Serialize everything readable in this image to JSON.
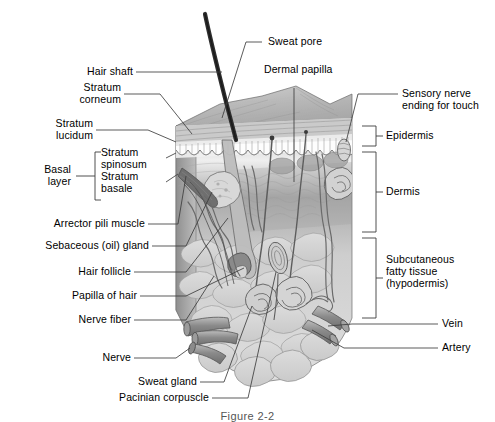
{
  "figure": {
    "caption": "Figure 2-2",
    "colors": {
      "ink": "#1a1a1a",
      "leader": "#3d3d3d",
      "hair": "#2f2f2f",
      "epidermis_top": "#b9b9b9",
      "epidermis_face": "#9a9a9a",
      "dermis": "#c9c9c9",
      "hypodermis": "#dcdcdc",
      "vessel": "#8d8d8d",
      "outline": "#5a5a5a"
    }
  },
  "labels_left": [
    {
      "id": "hair-shaft",
      "text": "Hair shaft"
    },
    {
      "id": "stratum-corneum",
      "text": "Stratum\ncorneum"
    },
    {
      "id": "stratum-lucidum",
      "text": "Stratum\nlucidum"
    },
    {
      "id": "basal-layer",
      "text": "Basal\nlayer"
    },
    {
      "id": "stratum-spinosum",
      "text": "Stratum\nspinosum"
    },
    {
      "id": "stratum-basale",
      "text": "Stratum\nbasale"
    },
    {
      "id": "arrector-pili-muscle",
      "text": "Arrector pili muscle"
    },
    {
      "id": "sebaceous-gland",
      "text": "Sebaceous (oil) gland"
    },
    {
      "id": "hair-follicle",
      "text": "Hair follicle"
    },
    {
      "id": "papilla-of-hair",
      "text": "Papilla of hair"
    },
    {
      "id": "nerve-fiber",
      "text": "Nerve fiber"
    },
    {
      "id": "nerve",
      "text": "Nerve"
    },
    {
      "id": "sweat-gland",
      "text": "Sweat gland"
    },
    {
      "id": "pacinian-corpuscle",
      "text": "Pacinian corpuscle"
    }
  ],
  "labels_top": [
    {
      "id": "sweat-pore",
      "text": "Sweat pore"
    },
    {
      "id": "dermal-papilla",
      "text": "Dermal papilla"
    }
  ],
  "labels_right": [
    {
      "id": "sensory-nerve-ending",
      "text": "Sensory nerve\nending for touch"
    },
    {
      "id": "epidermis",
      "text": "Epidermis"
    },
    {
      "id": "dermis",
      "text": "Dermis"
    },
    {
      "id": "subcutaneous-fatty-tissue",
      "text": "Subcutaneous\nfatty tissue\n(hypodermis)"
    },
    {
      "id": "vein",
      "text": "Vein"
    },
    {
      "id": "artery",
      "text": "Artery"
    }
  ],
  "structures": [
    "hair shaft",
    "sweat pore",
    "dermal papilla",
    "sensory nerve ending for touch",
    "stratum corneum",
    "stratum lucidum",
    "stratum spinosum",
    "stratum basale",
    "arrector pili muscle",
    "sebaceous (oil) gland",
    "hair follicle",
    "papilla of hair",
    "nerve fiber",
    "nerve",
    "sweat gland",
    "pacinian corpuscle",
    "vein",
    "artery"
  ]
}
